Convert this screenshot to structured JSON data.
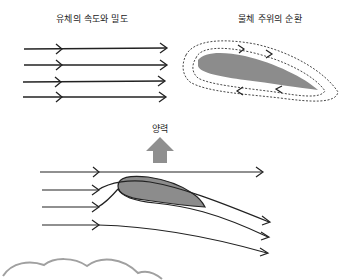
{
  "labels": {
    "fluid_speed_density": "유체의 속도와 밀도",
    "circulation_around_object": "물체 주위의 순환",
    "lift": "양력"
  },
  "colors": {
    "stroke": "#222222",
    "airfoil_fill": "#8c8c8c",
    "lift_arrow": "#8f8f8f",
    "cloud": "#a0a0a0",
    "background": "#ffffff"
  },
  "panels": [
    {
      "id": "uniform-flow",
      "title_key": "fluid_speed_density",
      "arrows": 4
    },
    {
      "id": "circulation",
      "title_key": "circulation_around_object",
      "loops": 2
    },
    {
      "id": "lift-flow",
      "title_key": "lift",
      "streamlines": 4
    }
  ]
}
